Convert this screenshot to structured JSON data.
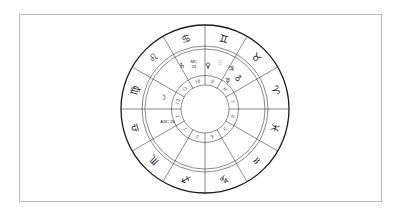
{
  "page": {
    "background": "#ffffff",
    "card_border": "#b9b9b9"
  },
  "chart_data": {
    "type": "astrology-natal-wheel",
    "ascendant": {
      "label": "ASC 20",
      "sign": "Libra"
    },
    "midheaven": {
      "label": "MC 23",
      "sign": "Cancer"
    },
    "zodiac_signs": [
      {
        "name": "aries",
        "glyph": "♈",
        "house": 7
      },
      {
        "name": "taurus",
        "glyph": "♉",
        "house": 8
      },
      {
        "name": "gemini",
        "glyph": "♊",
        "house": 9
      },
      {
        "name": "cancer",
        "glyph": "♋",
        "house": 10
      },
      {
        "name": "leo",
        "glyph": "♌",
        "house": 11
      },
      {
        "name": "virgo",
        "glyph": "♍",
        "house": 12
      },
      {
        "name": "libra",
        "glyph": "♎",
        "house": 1
      },
      {
        "name": "scorpio",
        "glyph": "♏",
        "house": 2
      },
      {
        "name": "sagittarius",
        "glyph": "♐",
        "house": 3
      },
      {
        "name": "capricorn",
        "glyph": "♑",
        "house": 4
      },
      {
        "name": "aquarius",
        "glyph": "♒",
        "house": 5
      },
      {
        "name": "pisces",
        "glyph": "♓",
        "house": 6
      }
    ],
    "house_numbers": [
      "1",
      "2",
      "3",
      "4",
      "5",
      "6",
      "7",
      "8",
      "9",
      "10",
      "11",
      "12"
    ],
    "planets": [
      {
        "name": "saturn",
        "glyph": "♄",
        "house": 10,
        "angle_deg": 118,
        "radius_frac": 0.58,
        "color": "#1a1a1a"
      },
      {
        "name": "venus",
        "glyph": "♀",
        "house": 9,
        "angle_deg": 86,
        "radius_frac": 0.52,
        "color": "#1a1a1a"
      },
      {
        "name": "sun",
        "glyph": "☉",
        "house": 9,
        "angle_deg": 72,
        "radius_frac": 0.58,
        "color": "#8c8c8c"
      },
      {
        "name": "jupiter",
        "glyph": "♃",
        "house": 8,
        "angle_deg": 57,
        "radius_frac": 0.57,
        "color": "#1a1a1a"
      },
      {
        "name": "mercury",
        "glyph": "☿",
        "house": 8,
        "angle_deg": 51,
        "radius_frac": 0.43,
        "color": "#1a1a1a"
      },
      {
        "name": "mars",
        "glyph": "♂",
        "house": 8,
        "angle_deg": 43,
        "radius_frac": 0.54,
        "color": "#1a1a1a"
      },
      {
        "name": "moon",
        "glyph": "☽",
        "house": 12,
        "angle_deg": 165,
        "radius_frac": 0.52,
        "color": "#1a1a1a"
      }
    ],
    "angle_labels": [
      {
        "name": "mc",
        "lines": [
          "MC",
          "23"
        ],
        "angle_deg": 104,
        "radius_frac": 0.55
      },
      {
        "name": "asc",
        "lines": [
          "ASC 20"
        ],
        "angle_deg": 199,
        "radius_frac": 0.47
      }
    ],
    "colors": {
      "outer_ring": "#1c1c1c",
      "line": "#2b2b2b",
      "text": "#1a1a1a"
    }
  }
}
